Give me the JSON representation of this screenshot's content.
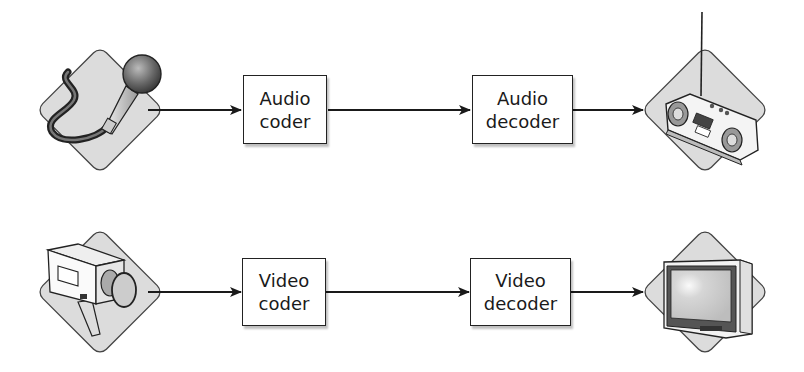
{
  "diagram": {
    "rows": [
      {
        "name": "audio",
        "source": {
          "icon": "microphone-icon",
          "label": "Microphone"
        },
        "coder": {
          "line1": "Audio",
          "line2": "coder"
        },
        "decoder": {
          "line1": "Audio",
          "line2": "decoder"
        },
        "sink": {
          "icon": "radio-icon",
          "label": "Radio"
        }
      },
      {
        "name": "video",
        "source": {
          "icon": "video-camera-icon",
          "label": "Video camera"
        },
        "coder": {
          "line1": "Video",
          "line2": "coder"
        },
        "decoder": {
          "line1": "Video",
          "line2": "decoder"
        },
        "sink": {
          "icon": "television-icon",
          "label": "Television"
        }
      }
    ],
    "colors": {
      "line": "#1a1a1a",
      "diamond_fill": "#dcdcdc",
      "box_border": "#222222",
      "background": "#ffffff"
    }
  }
}
